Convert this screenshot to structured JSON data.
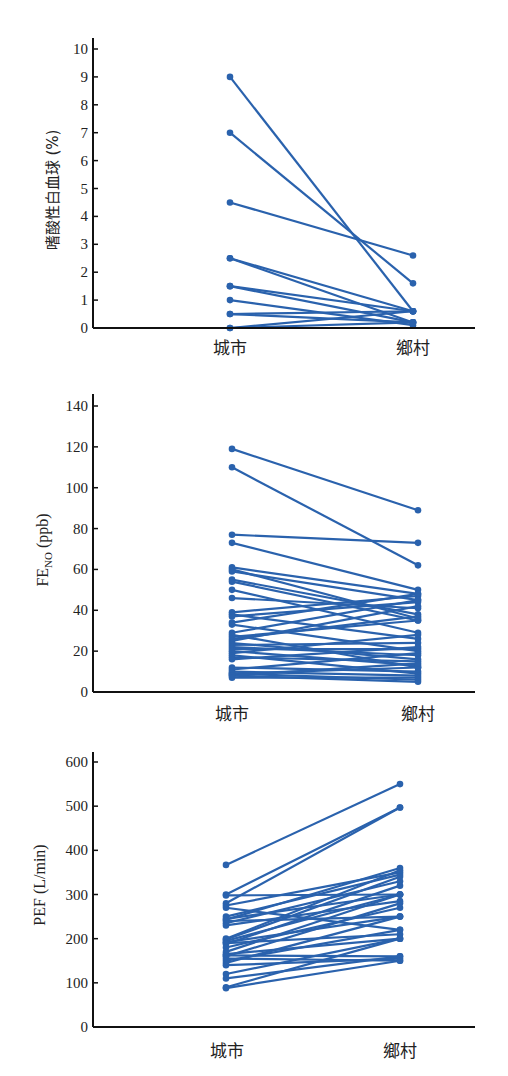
{
  "chart_data": [
    {
      "type": "line",
      "subtype": "paired-dot",
      "title": "",
      "xlabel": "",
      "ylabel": "嗜酸性白血球 (%)",
      "categories": [
        "城市",
        "鄉村"
      ],
      "ylim": [
        0,
        10
      ],
      "yticks": [
        0,
        1,
        2,
        3,
        4,
        5,
        6,
        7,
        8,
        9,
        10
      ],
      "grid": false,
      "color": "#2a62ad",
      "pairs": [
        [
          9.0,
          0.6
        ],
        [
          7.0,
          1.6
        ],
        [
          4.5,
          2.6
        ],
        [
          2.5,
          0.6
        ],
        [
          2.5,
          0.2
        ],
        [
          1.5,
          0.6
        ],
        [
          1.5,
          0.2
        ],
        [
          1.0,
          0.1
        ],
        [
          0.5,
          0.6
        ],
        [
          0.5,
          0.2
        ],
        [
          0.0,
          0.6
        ],
        [
          0.0,
          0.2
        ]
      ]
    },
    {
      "type": "line",
      "subtype": "paired-dot",
      "title": "",
      "xlabel": "",
      "ylabel": "FE",
      "ylabel_sub": "NO",
      "ylabel_unit": " (ppb)",
      "categories": [
        "城市",
        "鄉村"
      ],
      "ylim": [
        0,
        140
      ],
      "yticks": [
        0,
        20,
        40,
        60,
        80,
        100,
        120,
        140
      ],
      "grid": false,
      "color": "#2a62ad",
      "pairs": [
        [
          119,
          89
        ],
        [
          110,
          62
        ],
        [
          77,
          73
        ],
        [
          73,
          50
        ],
        [
          61,
          48
        ],
        [
          60,
          36
        ],
        [
          59,
          45
        ],
        [
          55,
          38
        ],
        [
          54,
          35
        ],
        [
          50,
          29
        ],
        [
          46,
          41
        ],
        [
          39,
          47
        ],
        [
          38,
          26
        ],
        [
          37,
          44
        ],
        [
          34,
          48
        ],
        [
          33,
          20
        ],
        [
          29,
          45
        ],
        [
          28,
          12
        ],
        [
          27,
          35
        ],
        [
          26,
          37
        ],
        [
          25,
          42
        ],
        [
          24,
          16
        ],
        [
          23,
          24
        ],
        [
          22,
          18
        ],
        [
          21,
          21
        ],
        [
          20,
          13
        ],
        [
          19,
          28
        ],
        [
          18,
          9
        ],
        [
          17,
          15
        ],
        [
          16,
          22
        ],
        [
          12,
          10
        ],
        [
          11,
          19
        ],
        [
          10,
          8
        ],
        [
          9,
          6
        ],
        [
          9,
          12
        ],
        [
          8,
          5
        ],
        [
          8,
          14
        ],
        [
          7,
          7
        ]
      ]
    },
    {
      "type": "line",
      "subtype": "paired-dot",
      "title": "",
      "xlabel": "",
      "ylabel": "PEF (L/min)",
      "categories": [
        "城市",
        "鄉村"
      ],
      "ylim": [
        0,
        600
      ],
      "yticks": [
        0,
        100,
        200,
        300,
        400,
        500,
        600
      ],
      "grid": false,
      "color": "#2a62ad",
      "pairs": [
        [
          367,
          550
        ],
        [
          300,
          497
        ],
        [
          298,
          300
        ],
        [
          280,
          497
        ],
        [
          275,
          350
        ],
        [
          270,
          220
        ],
        [
          250,
          345
        ],
        [
          245,
          300
        ],
        [
          243,
          360
        ],
        [
          240,
          250
        ],
        [
          235,
          330
        ],
        [
          230,
          285
        ],
        [
          200,
          355
        ],
        [
          198,
          340
        ],
        [
          195,
          300
        ],
        [
          192,
          250
        ],
        [
          190,
          210
        ],
        [
          188,
          320
        ],
        [
          180,
          270
        ],
        [
          170,
          300
        ],
        [
          165,
          200
        ],
        [
          162,
          160
        ],
        [
          160,
          280
        ],
        [
          155,
          150
        ],
        [
          150,
          220
        ],
        [
          145,
          250
        ],
        [
          140,
          155
        ],
        [
          120,
          200
        ],
        [
          110,
          160
        ],
        [
          90,
          200
        ],
        [
          88,
          150
        ]
      ]
    }
  ],
  "panels": [
    {
      "ylabel": "嗜酸性白血球 (%)",
      "yticks": [
        "0",
        "1",
        "2",
        "3",
        "4",
        "5",
        "6",
        "7",
        "8",
        "9",
        "10"
      ],
      "categories": [
        "城市",
        "鄉村"
      ]
    },
    {
      "ylabel_main": "FE",
      "ylabel_sub": "NO",
      "ylabel_unit": " (ppb)",
      "yticks": [
        "0",
        "20",
        "40",
        "60",
        "80",
        "100",
        "120",
        "140"
      ],
      "categories": [
        "城市",
        "鄉村"
      ]
    },
    {
      "ylabel": "PEF (L/min)",
      "yticks": [
        "0",
        "100",
        "200",
        "300",
        "400",
        "500",
        "600"
      ],
      "categories": [
        "城市",
        "鄉村"
      ]
    }
  ]
}
